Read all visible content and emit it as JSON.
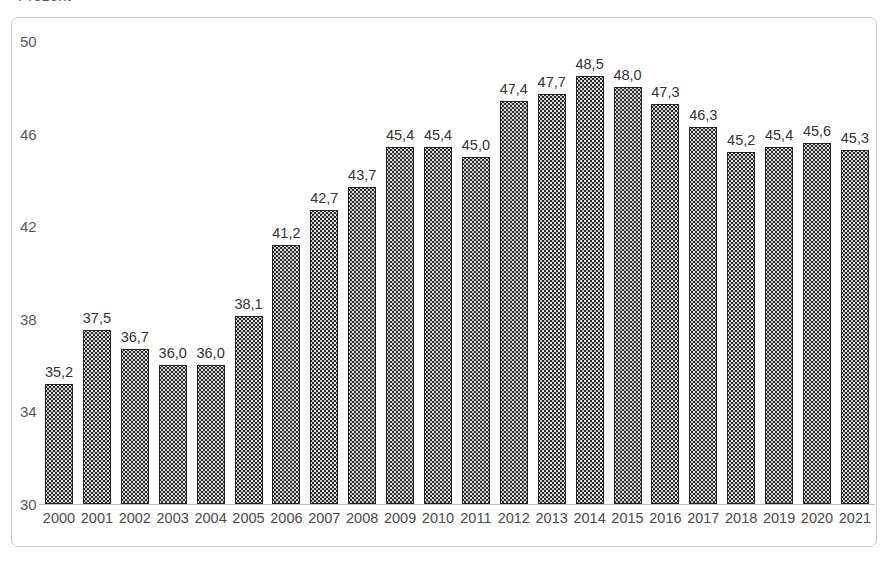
{
  "clipped_header": "Prozent",
  "chart_data": {
    "type": "bar",
    "title": "",
    "subtitle": "",
    "xlabel": "",
    "ylabel": "",
    "categories": [
      "2000",
      "2001",
      "2002",
      "2003",
      "2004",
      "2005",
      "2006",
      "2007",
      "2008",
      "2009",
      "2010",
      "2011",
      "2012",
      "2013",
      "2014",
      "2015",
      "2016",
      "2017",
      "2018",
      "2019",
      "2020",
      "2021"
    ],
    "values": [
      35.2,
      37.5,
      36.7,
      36.0,
      36.0,
      38.1,
      41.2,
      42.7,
      43.7,
      45.4,
      45.4,
      45.0,
      47.4,
      47.7,
      48.5,
      48.0,
      47.3,
      46.3,
      45.2,
      45.4,
      45.6,
      45.3
    ],
    "value_labels": [
      "35,2",
      "37,5",
      "36,7",
      "36,0",
      "36,0",
      "38,1",
      "41,2",
      "42,7",
      "43,7",
      "45,4",
      "45,4",
      "45,0",
      "47,4",
      "47,7",
      "48,5",
      "48,0",
      "47,3",
      "46,3",
      "45,2",
      "45,4",
      "45,6",
      "45,3"
    ],
    "ylim": [
      30,
      50
    ],
    "yticks": [
      30,
      34,
      38,
      42,
      46,
      50
    ],
    "ytick_labels": [
      "30",
      "34",
      "38",
      "42",
      "46",
      "50"
    ],
    "grid": false,
    "legend": null,
    "legend_position": "none",
    "bar_color": "#2b2b2b",
    "bar_pattern": "fine-dotted",
    "axis_color": "#bdbdbd",
    "frame_color": "#c9c9c9",
    "background_color": "#ffffff",
    "label_color": "#333333",
    "ytick_color": "#595959",
    "xtick_color": "#4a4a4a"
  }
}
